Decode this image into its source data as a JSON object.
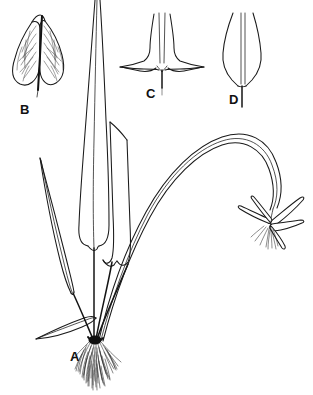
{
  "figure": {
    "style": "black ink line drawing on white background",
    "background_color": "#ffffff",
    "ink_color": "#1a1a1a",
    "width_px": 313,
    "height_px": 395
  },
  "panels": [
    {
      "id": "A",
      "label": "A",
      "label_x": 70,
      "label_y": 361,
      "description": "whole plant habit: rosette of long strap-shaped basal leaves, dense fibrous root mass, and an arching scape bearing a single flower",
      "parts": [
        "long erect central leaf running off the top of the frame",
        "slender pointed leaf on the left",
        "broad rounded-base leaves in the centre",
        "small lateral leaf near the base at left",
        "arching flowering scape curving to the right",
        "terminal flower with narrow spreading tepals and a fringed lip",
        "dense fibrous root mass below the crown"
      ]
    },
    {
      "id": "B",
      "label": "B",
      "label_x": 20,
      "label_y": 114,
      "description": "enlarged bilobed (auriculate) leaf base with reticulate venation and dark central midrib"
    },
    {
      "id": "C",
      "label": "C",
      "label_x": 146,
      "label_y": 98,
      "description": "enlarged hastate leaf base with two sharply pointed horizontally spreading lobes"
    },
    {
      "id": "D",
      "label": "D",
      "label_x": 229,
      "label_y": 104,
      "description": "enlarged narrow attenuate leaf base tapering into a short petiole"
    }
  ],
  "colors": {
    "ink": "#1a1a1a",
    "vein": "#2b2b2b",
    "crown": "#101010",
    "paper": "#ffffff"
  }
}
